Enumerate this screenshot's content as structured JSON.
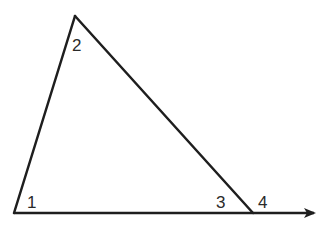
{
  "diagram": {
    "type": "triangle-with-extended-base",
    "stroke_color": "#1e1e1e",
    "vertices": {
      "apex": [
        75,
        16
      ],
      "left": [
        14,
        213
      ],
      "right": [
        253,
        213
      ]
    },
    "ray_end": [
      318,
      213
    ],
    "angle_labels": [
      {
        "label": "1",
        "x": 27,
        "y": 208
      },
      {
        "label": "2",
        "x": 72,
        "y": 51
      },
      {
        "label": "3",
        "x": 216,
        "y": 208
      },
      {
        "label": "4",
        "x": 258,
        "y": 208
      }
    ]
  }
}
